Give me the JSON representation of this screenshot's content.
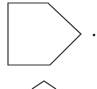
{
  "diagram": {
    "stroke_color": "#333333",
    "background": "#ffffff",
    "shapes": [
      {
        "type": "pentagon-arrow",
        "points": "8,3 48,3 81,34 50,65 8,65"
      },
      {
        "type": "dot",
        "cx": 94,
        "cy": 35,
        "r": 1.3
      },
      {
        "type": "chevron",
        "points": "32,89 44,81 56,89"
      }
    ]
  }
}
